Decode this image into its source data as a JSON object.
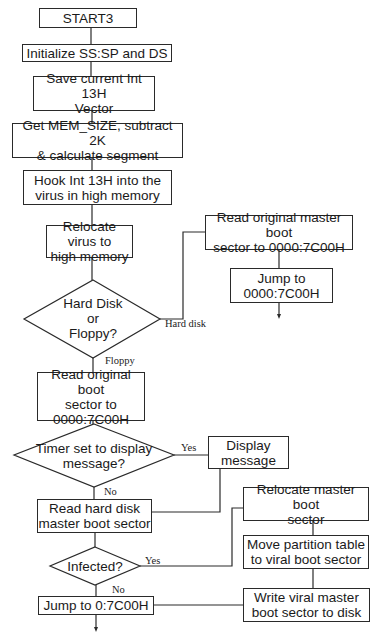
{
  "flowchart": {
    "nodes": {
      "start": "START3",
      "init": "Initialize SS:SP and DS",
      "save_vector": "Save current Int 13H\nVector",
      "get_mem": "Get MEM_SIZE, subtract 2K\n& calculate segment",
      "hook": "Hook Int 13H into the\nvirus in high memory",
      "relocate_virus": "Relocate virus to\nhigh memory",
      "decision_disk": "Hard Disk\nor\nFloppy?",
      "read_master_orig": "Read original master boot\nsector to 0000:7C00H",
      "jump_0000": "Jump to\n0000:7C00H",
      "read_boot_orig": "Read original boot\nsector to\n0000:7C00H",
      "decision_timer": "Timer set to display\nmessage?",
      "display_message": "Display\nmessage",
      "read_hd_master": "Read hard disk\nmaster boot sector",
      "decision_infected": "Infected?",
      "jump_0": "Jump to 0:7C00H",
      "relocate_master": "Relocate master boot\nsector",
      "move_partition": "Move partition table\nto viral boot sector",
      "write_viral": "Write viral master\nboot sector to disk"
    },
    "edge_labels": {
      "hard_disk": "Hard disk",
      "floppy": "Floppy",
      "timer_yes": "Yes",
      "timer_no": "No",
      "infected_yes": "Yes",
      "infected_no": "No"
    },
    "colors": {
      "line": "#2a2a2a",
      "background": "#ffffff"
    }
  }
}
